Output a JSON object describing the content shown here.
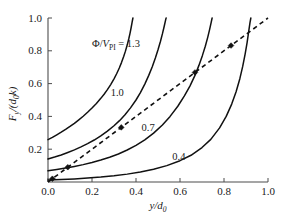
{
  "chart_data": {
    "type": "line",
    "title": "",
    "xlabel": "y/d0",
    "ylabel": "Fy/(d0k)",
    "xlabel_parts": {
      "num": "y",
      "den": "d",
      "den_sub": "0"
    },
    "ylabel_parts": {
      "sym": "F",
      "sym_sub": "y",
      "den1": "d",
      "den1_sub": "0",
      "den2": "k"
    },
    "xlim": [
      0.0,
      1.0
    ],
    "ylim": [
      0.0,
      1.0
    ],
    "xticks": [
      "0.0",
      "0.2",
      "0.4",
      "0.6",
      "0.8",
      "1.0"
    ],
    "xtick_values": [
      0.0,
      0.2,
      0.4,
      0.6,
      0.8,
      1.0
    ],
    "yticks": [
      "0.2",
      "0.4",
      "0.6",
      "0.8",
      "1.0"
    ],
    "ytick_values": [
      0.2,
      0.4,
      0.6,
      0.8,
      1.0
    ],
    "grid": false,
    "legend_position": "inline-curve-labels",
    "legend_title_parts": {
      "phi": "Φ",
      "slash": "/",
      "v": "V",
      "v_sub": "PI",
      "eq": " = ",
      "val": "1.3"
    },
    "legend_title": "Φ/VPI = 1.3",
    "annotations": [
      {
        "text": "Φ/VPI = 1.3",
        "x": 0.2,
        "y": 0.845,
        "name": "curve-label-1p3"
      },
      {
        "text": "1.0",
        "x": 0.315,
        "y": 0.545,
        "name": "curve-label-1p0"
      },
      {
        "text": "0.7",
        "x": 0.455,
        "y": 0.335,
        "name": "curve-label-0p7"
      },
      {
        "text": "0.4",
        "x": 0.595,
        "y": 0.155,
        "name": "curve-label-0p4"
      }
    ],
    "series": [
      {
        "name": "1.3",
        "style": "solid",
        "points": [
          [
            0.0,
            0.258
          ],
          [
            0.02,
            0.272
          ],
          [
            0.04,
            0.288
          ],
          [
            0.06,
            0.304
          ],
          [
            0.08,
            0.321
          ],
          [
            0.1,
            0.339
          ],
          [
            0.12,
            0.358
          ],
          [
            0.14,
            0.379
          ],
          [
            0.16,
            0.401
          ],
          [
            0.18,
            0.425
          ],
          [
            0.2,
            0.451
          ],
          [
            0.22,
            0.479
          ],
          [
            0.24,
            0.51
          ],
          [
            0.255,
            0.535
          ],
          [
            0.27,
            0.563
          ],
          [
            0.285,
            0.594
          ],
          [
            0.3,
            0.629
          ],
          [
            0.312,
            0.66
          ],
          [
            0.324,
            0.695
          ],
          [
            0.334,
            0.728
          ],
          [
            0.344,
            0.765
          ],
          [
            0.352,
            0.798
          ],
          [
            0.36,
            0.835
          ],
          [
            0.367,
            0.872
          ],
          [
            0.373,
            0.908
          ],
          [
            0.378,
            0.942
          ],
          [
            0.382,
            0.972
          ],
          [
            0.386,
            1.0
          ]
        ]
      },
      {
        "name": "1.0",
        "style": "solid",
        "points": [
          [
            0.0,
            0.14
          ],
          [
            0.03,
            0.152
          ],
          [
            0.06,
            0.165
          ],
          [
            0.09,
            0.18
          ],
          [
            0.12,
            0.196
          ],
          [
            0.15,
            0.214
          ],
          [
            0.18,
            0.234
          ],
          [
            0.21,
            0.256
          ],
          [
            0.24,
            0.281
          ],
          [
            0.27,
            0.31
          ],
          [
            0.3,
            0.343
          ],
          [
            0.325,
            0.374
          ],
          [
            0.35,
            0.41
          ],
          [
            0.375,
            0.452
          ],
          [
            0.4,
            0.5
          ],
          [
            0.42,
            0.545
          ],
          [
            0.44,
            0.597
          ],
          [
            0.458,
            0.65
          ],
          [
            0.474,
            0.703
          ],
          [
            0.488,
            0.756
          ],
          [
            0.5,
            0.806
          ],
          [
            0.511,
            0.857
          ],
          [
            0.52,
            0.903
          ],
          [
            0.528,
            0.948
          ],
          [
            0.535,
            0.99
          ],
          [
            0.537,
            1.0
          ]
        ]
      },
      {
        "name": "0.7",
        "style": "solid",
        "points": [
          [
            0.0,
            0.068
          ],
          [
            0.04,
            0.076
          ],
          [
            0.08,
            0.085
          ],
          [
            0.12,
            0.095
          ],
          [
            0.16,
            0.106
          ],
          [
            0.2,
            0.119
          ],
          [
            0.24,
            0.134
          ],
          [
            0.28,
            0.151
          ],
          [
            0.32,
            0.171
          ],
          [
            0.36,
            0.195
          ],
          [
            0.4,
            0.223
          ],
          [
            0.44,
            0.257
          ],
          [
            0.48,
            0.298
          ],
          [
            0.52,
            0.348
          ],
          [
            0.555,
            0.4
          ],
          [
            0.59,
            0.462
          ],
          [
            0.62,
            0.525
          ],
          [
            0.645,
            0.585
          ],
          [
            0.668,
            0.65
          ],
          [
            0.686,
            0.711
          ],
          [
            0.702,
            0.772
          ],
          [
            0.715,
            0.828
          ],
          [
            0.726,
            0.882
          ],
          [
            0.735,
            0.932
          ],
          [
            0.742,
            0.975
          ],
          [
            0.746,
            1.0
          ]
        ]
      },
      {
        "name": "0.4",
        "style": "solid",
        "points": [
          [
            0.0,
            0.012
          ],
          [
            0.06,
            0.015
          ],
          [
            0.12,
            0.019
          ],
          [
            0.18,
            0.024
          ],
          [
            0.24,
            0.03
          ],
          [
            0.3,
            0.038
          ],
          [
            0.36,
            0.048
          ],
          [
            0.42,
            0.061
          ],
          [
            0.48,
            0.078
          ],
          [
            0.54,
            0.1
          ],
          [
            0.6,
            0.13
          ],
          [
            0.65,
            0.163
          ],
          [
            0.7,
            0.21
          ],
          [
            0.74,
            0.26
          ],
          [
            0.78,
            0.33
          ],
          [
            0.81,
            0.4
          ],
          [
            0.835,
            0.475
          ],
          [
            0.855,
            0.55
          ],
          [
            0.872,
            0.63
          ],
          [
            0.885,
            0.705
          ],
          [
            0.896,
            0.78
          ],
          [
            0.905,
            0.85
          ],
          [
            0.912,
            0.915
          ],
          [
            0.918,
            0.97
          ],
          [
            0.922,
            1.0
          ]
        ]
      }
    ],
    "reference_line": {
      "name": "dashed-reference-line",
      "style": "dashed",
      "points": [
        [
          0.0,
          0.0
        ],
        [
          1.0,
          1.0
        ]
      ],
      "label": ""
    },
    "markers": [
      {
        "x": 0.02,
        "y": 0.02,
        "shape": "diamond",
        "name": "intersection-marker-0"
      },
      {
        "x": 0.09,
        "y": 0.09,
        "shape": "diamond",
        "name": "intersection-marker-1"
      },
      {
        "x": 0.333,
        "y": 0.333,
        "shape": "diamond",
        "name": "intersection-marker-2"
      },
      {
        "x": 0.668,
        "y": 0.668,
        "shape": "diamond",
        "name": "intersection-marker-3"
      },
      {
        "x": 0.832,
        "y": 0.832,
        "shape": "diamond",
        "name": "intersection-marker-4"
      }
    ],
    "colors": {
      "curve": "#111111",
      "axis": "#4d4d4d",
      "dashed": "#111111",
      "text": "#1a1a1a",
      "background": "#ffffff"
    }
  }
}
